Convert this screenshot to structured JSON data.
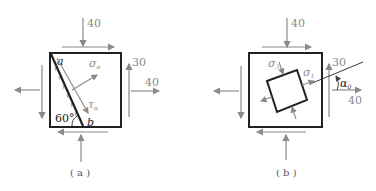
{
  "figure_a": {
    "caption": "( a )",
    "top_stress": "40",
    "right_shear": "30",
    "right_normal": "40",
    "point_a": "a",
    "point_b": "b",
    "angle": "60°",
    "sigma": "σ",
    "sigma_sub": "α",
    "tau": "τ",
    "tau_sub": "α"
  },
  "figure_b": {
    "caption": "( b )",
    "top_stress": "40",
    "right_shear": "30",
    "right_normal": "40",
    "sigma3": "σ",
    "sigma3_sub": "3",
    "sigma1": "σ",
    "sigma1_sub": "1",
    "alpha": "α",
    "alpha_sub": "0"
  },
  "colors": {
    "arrow": "#8a8a8a",
    "frame": "#222222"
  }
}
